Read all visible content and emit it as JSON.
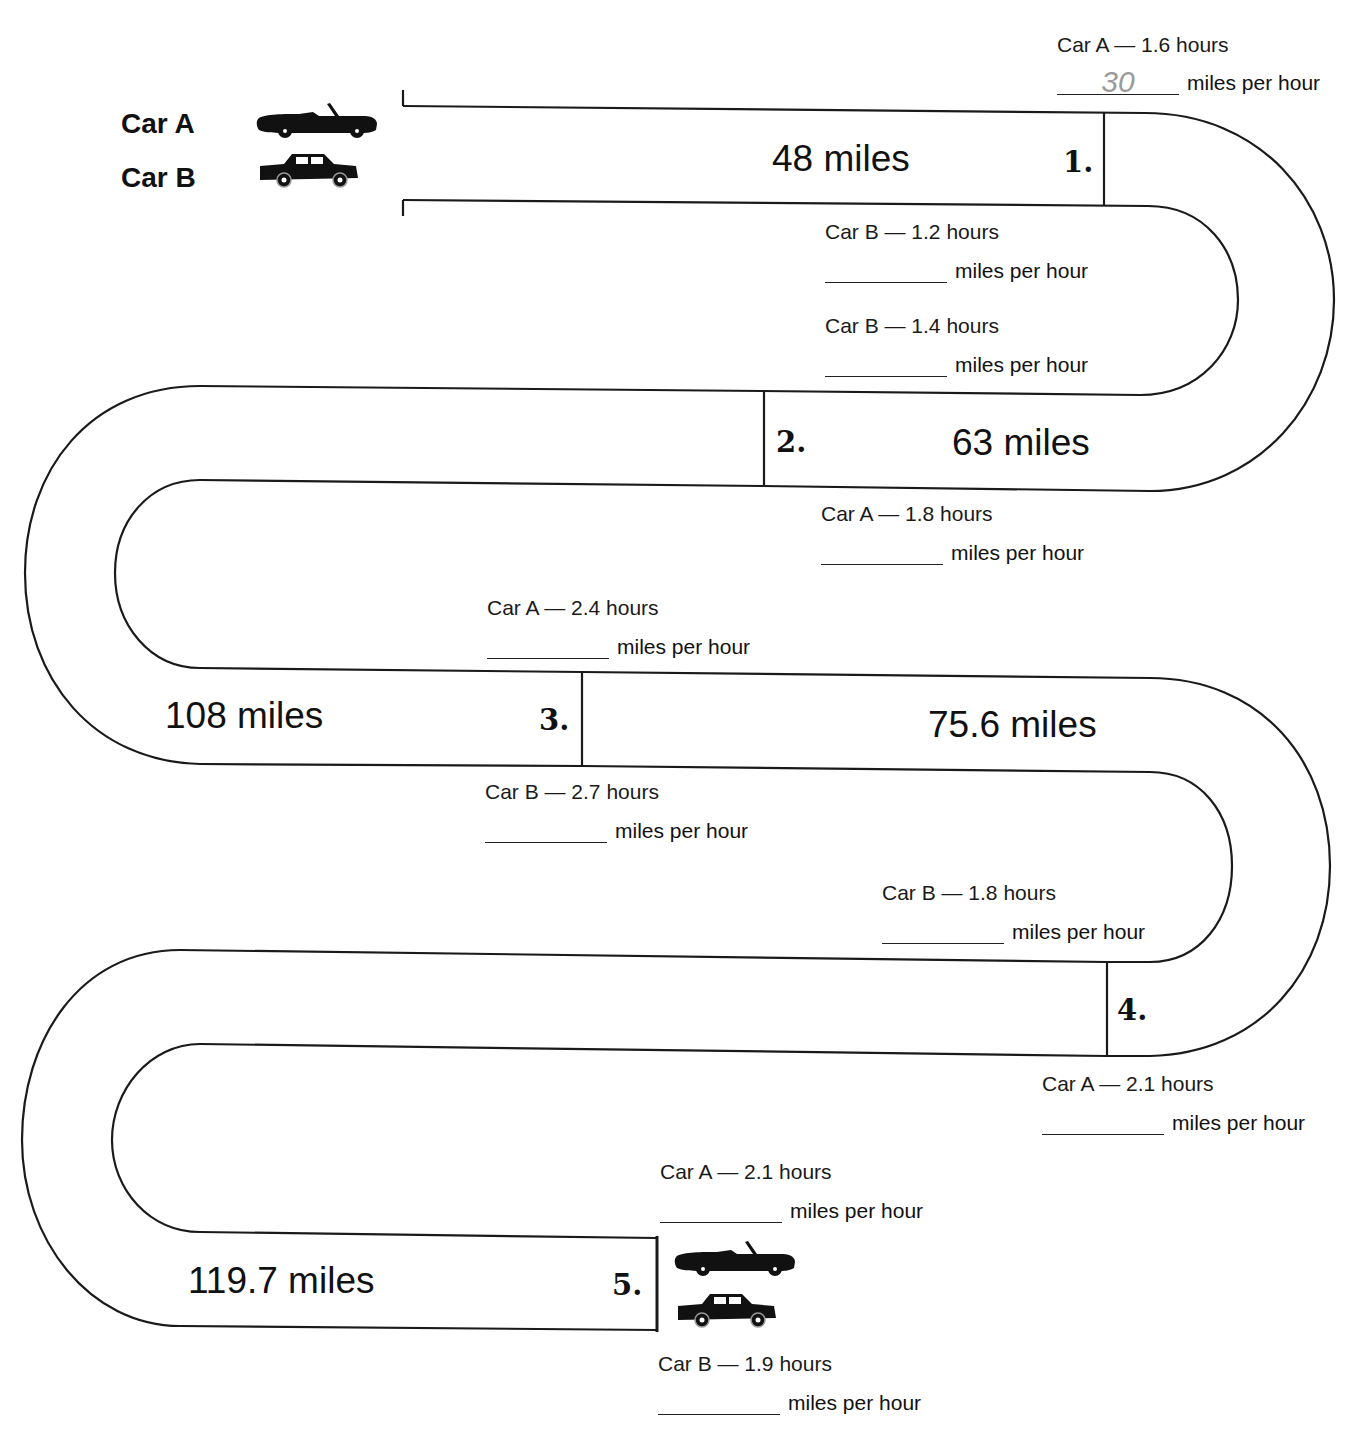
{
  "legend": {
    "car_a": "Car A",
    "car_b": "Car B",
    "icons": [
      "convertible-car-icon",
      "sedan-car-icon"
    ]
  },
  "unit_label": "miles per hour",
  "segments": [
    {
      "number": "1.",
      "distance": "48 miles",
      "car_a": {
        "label": "Car A — 1.6 hours",
        "answer": "30"
      },
      "car_b": {
        "label": "Car B — 1.2 hours",
        "answer": ""
      }
    },
    {
      "number": "2.",
      "distance": "63 miles",
      "car_b": {
        "label": "Car B — 1.4 hours",
        "answer": ""
      },
      "car_a": {
        "label": "Car A — 1.8 hours",
        "answer": ""
      }
    },
    {
      "number": "3.",
      "distance_left": "108 miles",
      "distance_right": "75.6 miles",
      "car_a": {
        "label": "Car A — 2.4 hours",
        "answer": ""
      },
      "car_b": {
        "label": "Car B — 2.7 hours",
        "answer": ""
      }
    },
    {
      "number": "4.",
      "car_b": {
        "label": "Car B — 1.8 hours",
        "answer": ""
      },
      "car_a": {
        "label": "Car A — 2.1 hours",
        "answer": ""
      }
    },
    {
      "number": "5.",
      "distance": "119.7 miles",
      "car_a": {
        "label": "Car A — 2.1 hours",
        "answer": ""
      },
      "car_b": {
        "label": "Car B — 1.9 hours",
        "answer": ""
      }
    }
  ]
}
